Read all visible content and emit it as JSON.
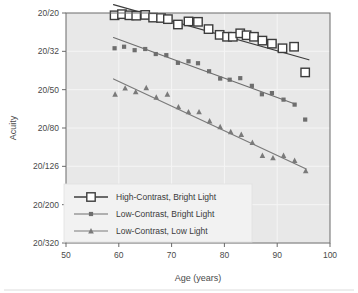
{
  "chart_data": {
    "type": "scatter",
    "title": "",
    "xlabel": "Age (years)",
    "ylabel": "Acuity",
    "xlim": [
      50,
      100
    ],
    "ylim_index": [
      0,
      6
    ],
    "xticks": [
      50,
      60,
      70,
      80,
      90,
      100
    ],
    "xtick_labels": [
      "50",
      "60",
      "70",
      "80",
      "90",
      "100"
    ],
    "ytick_labels": [
      "20/20",
      "20/32",
      "20/50",
      "20/80",
      "20/126",
      "20/200",
      "20/320"
    ],
    "grid": true,
    "legend_position": "lower left",
    "series": [
      {
        "name": "High-Contrast, Bright Light",
        "marker": "open-square",
        "color": "#3c3c3c",
        "fit_line": {
          "x0": 59,
          "y0": -0.22,
          "x1": 96,
          "y1": 1.22
        },
        "points": [
          {
            "x": 59.2,
            "y": 0.06
          },
          {
            "x": 60.6,
            "y": 0.03
          },
          {
            "x": 62.0,
            "y": 0.06
          },
          {
            "x": 63.3,
            "y": 0.07
          },
          {
            "x": 65.0,
            "y": 0.05
          },
          {
            "x": 66.5,
            "y": 0.12
          },
          {
            "x": 68.0,
            "y": 0.13
          },
          {
            "x": 69.3,
            "y": 0.16
          },
          {
            "x": 71.2,
            "y": 0.3
          },
          {
            "x": 73.2,
            "y": 0.22
          },
          {
            "x": 75.0,
            "y": 0.23
          },
          {
            "x": 77.0,
            "y": 0.42
          },
          {
            "x": 79.1,
            "y": 0.57
          },
          {
            "x": 80.5,
            "y": 0.62
          },
          {
            "x": 81.6,
            "y": 0.62
          },
          {
            "x": 83.0,
            "y": 0.53
          },
          {
            "x": 84.2,
            "y": 0.58
          },
          {
            "x": 85.6,
            "y": 0.62
          },
          {
            "x": 87.2,
            "y": 0.72
          },
          {
            "x": 89.0,
            "y": 0.8
          },
          {
            "x": 91.0,
            "y": 0.92
          },
          {
            "x": 93.2,
            "y": 0.88
          },
          {
            "x": 95.3,
            "y": 1.55
          }
        ]
      },
      {
        "name": "Low-Contrast, Bright Light",
        "marker": "filled-square",
        "color": "#6e6e6e",
        "fit_line": {
          "x0": 59,
          "y0": 0.64,
          "x1": 93.5,
          "y1": 2.38
        },
        "points": [
          {
            "x": 59.2,
            "y": 0.92
          },
          {
            "x": 61.0,
            "y": 0.88
          },
          {
            "x": 63.0,
            "y": 0.97
          },
          {
            "x": 65.0,
            "y": 0.94
          },
          {
            "x": 67.0,
            "y": 1.07
          },
          {
            "x": 69.0,
            "y": 1.1
          },
          {
            "x": 71.2,
            "y": 1.3
          },
          {
            "x": 73.2,
            "y": 1.26
          },
          {
            "x": 75.0,
            "y": 1.31
          },
          {
            "x": 77.1,
            "y": 1.52
          },
          {
            "x": 79.2,
            "y": 1.71
          },
          {
            "x": 81.0,
            "y": 1.74
          },
          {
            "x": 83.0,
            "y": 1.7
          },
          {
            "x": 85.2,
            "y": 1.9
          },
          {
            "x": 87.1,
            "y": 2.12
          },
          {
            "x": 89.0,
            "y": 2.09
          },
          {
            "x": 91.2,
            "y": 2.26
          },
          {
            "x": 93.3,
            "y": 2.39
          },
          {
            "x": 95.3,
            "y": 2.78
          }
        ]
      },
      {
        "name": "Low-Contrast, Low Light",
        "marker": "triangle",
        "color": "#7a7a7a",
        "fit_line": {
          "x0": 59,
          "y0": 1.72,
          "x1": 95.5,
          "y1": 4.07
        },
        "points": [
          {
            "x": 59.3,
            "y": 2.12
          },
          {
            "x": 61.2,
            "y": 1.96
          },
          {
            "x": 63.2,
            "y": 2.06
          },
          {
            "x": 65.2,
            "y": 1.95
          },
          {
            "x": 67.1,
            "y": 2.2
          },
          {
            "x": 69.2,
            "y": 2.12
          },
          {
            "x": 71.3,
            "y": 2.45
          },
          {
            "x": 73.2,
            "y": 2.58
          },
          {
            "x": 75.2,
            "y": 2.58
          },
          {
            "x": 77.2,
            "y": 2.82
          },
          {
            "x": 79.2,
            "y": 2.97
          },
          {
            "x": 81.2,
            "y": 3.1
          },
          {
            "x": 83.2,
            "y": 3.17
          },
          {
            "x": 85.3,
            "y": 3.38
          },
          {
            "x": 87.2,
            "y": 3.72
          },
          {
            "x": 89.2,
            "y": 3.78
          },
          {
            "x": 91.2,
            "y": 3.72
          },
          {
            "x": 93.3,
            "y": 3.85
          },
          {
            "x": 95.4,
            "y": 4.12
          }
        ]
      }
    ],
    "legend_entries": [
      {
        "label": "High-Contrast, Bright Light",
        "marker": "open-square"
      },
      {
        "label": "Low-Contrast, Bright Light",
        "marker": "filled-square"
      },
      {
        "label": "Low-Contrast, Low Light",
        "marker": "triangle"
      }
    ],
    "colors": {
      "plot_background": "#e8e8e8",
      "grid": "#f5f5f5",
      "axis": "#6a6a6a",
      "text": "#4a4a4a",
      "page_background": "#ffffff",
      "legend_background": "#f2f2f2"
    }
  }
}
